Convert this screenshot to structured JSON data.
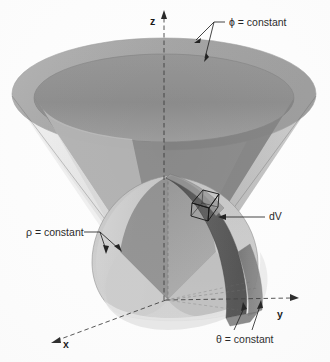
{
  "figure": {
    "background_color": "#fdfdfd",
    "axes": [
      {
        "id": "z",
        "label": "z",
        "direction": "up",
        "style": "dashed-arrow"
      },
      {
        "id": "x",
        "label": "x",
        "direction": "down-left",
        "style": "dashed-arrow"
      },
      {
        "id": "y",
        "label": "y",
        "direction": "down-right",
        "style": "dashed-arrow"
      }
    ],
    "annotations": [
      {
        "id": "phi",
        "text": "ϕ = constant",
        "leaders": 2,
        "points_to": "cone surface"
      },
      {
        "id": "rho",
        "text": "ρ = constant",
        "leaders": 2,
        "points_to": "sphere surface"
      },
      {
        "id": "theta",
        "text": "θ = constant",
        "leaders": 2,
        "points_to": "radial wedge faces"
      },
      {
        "id": "dv",
        "text": "dV",
        "leaders": 1,
        "points_to": "volume element"
      }
    ],
    "colors": {
      "cone_inner": "#8c8c8c",
      "cone_rim": "#a6a6a6",
      "cone_outer": "#dcdcdc",
      "cone_outer_light": "#ececec",
      "sphere_light": "#cfcfcf",
      "sphere_mid": "#b4b4b4",
      "sphere_dark": "#8f8f8f",
      "band_dark": "#5b5b5b",
      "band_darker": "#4a4a4a",
      "outline": "#5a5a5a",
      "text": "#1c1c1c"
    }
  }
}
